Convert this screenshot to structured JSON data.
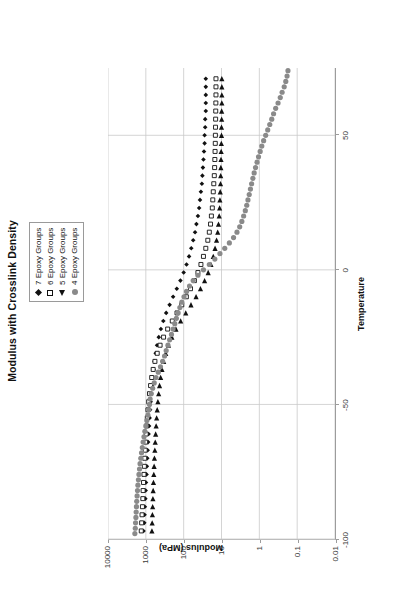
{
  "chart_data": {
    "type": "scatter",
    "title": "Modulus with Crosslink Density",
    "xlabel": "Temperature",
    "ylabel": "Modulus (MPa)",
    "xlim": [
      -100,
      75
    ],
    "ylim": [
      0.01,
      10000
    ],
    "yscale": "log",
    "xticks": [
      -100,
      -50,
      0,
      50
    ],
    "xticklabels": [
      "-100",
      "-50",
      "0",
      "50"
    ],
    "yticks": [
      10000,
      1000,
      100,
      10,
      1,
      0.1,
      0.01
    ],
    "yticklabels": [
      "10000",
      "1000",
      "100",
      "10",
      "1",
      "0.1",
      "0.01"
    ],
    "grid": "y-decades-and-x-ticks",
    "legend_position": "top-center-above-plot",
    "series": [
      {
        "name": "7 Epoxy Groups",
        "marker": "filled-diamond",
        "color": "#111111",
        "points": [
          [
            -97,
            1150
          ],
          [
            -94,
            1100
          ],
          [
            -91,
            1080
          ],
          [
            -88,
            1060
          ],
          [
            -85,
            1030
          ],
          [
            -82,
            1010
          ],
          [
            -79,
            990
          ],
          [
            -76,
            960
          ],
          [
            -73,
            940
          ],
          [
            -70,
            915
          ],
          [
            -67,
            895
          ],
          [
            -64,
            870
          ],
          [
            -61,
            845
          ],
          [
            -58,
            820
          ],
          [
            -55,
            795
          ],
          [
            -52,
            770
          ],
          [
            -49,
            745
          ],
          [
            -46,
            720
          ],
          [
            -43,
            690
          ],
          [
            -40,
            660
          ],
          [
            -37,
            625
          ],
          [
            -34,
            590
          ],
          [
            -31,
            550
          ],
          [
            -28,
            505
          ],
          [
            -25,
            455
          ],
          [
            -22,
            400
          ],
          [
            -19,
            345
          ],
          [
            -16,
            290
          ],
          [
            -13,
            235
          ],
          [
            -10,
            190
          ],
          [
            -7,
            152
          ],
          [
            -4,
            122
          ],
          [
            -1,
            100
          ],
          [
            2,
            84
          ],
          [
            5,
            72
          ],
          [
            8,
            63
          ],
          [
            11,
            56
          ],
          [
            14,
            50
          ],
          [
            17,
            46
          ],
          [
            20,
            42
          ],
          [
            23,
            39
          ],
          [
            26,
            37
          ],
          [
            29,
            35
          ],
          [
            32,
            33
          ],
          [
            35,
            32
          ],
          [
            38,
            31
          ],
          [
            41,
            30
          ],
          [
            44,
            29
          ],
          [
            47,
            28
          ],
          [
            50,
            28
          ],
          [
            53,
            27
          ],
          [
            56,
            27
          ],
          [
            59,
            26
          ],
          [
            62,
            26
          ],
          [
            65,
            26
          ],
          [
            68,
            26
          ],
          [
            71,
            26
          ]
        ]
      },
      {
        "name": "6 Epoxy Groups",
        "marker": "open-square",
        "color": "#111111",
        "points": [
          [
            -97,
            1320
          ],
          [
            -94,
            1290
          ],
          [
            -91,
            1260
          ],
          [
            -88,
            1230
          ],
          [
            -85,
            1200
          ],
          [
            -82,
            1180
          ],
          [
            -79,
            1150
          ],
          [
            -76,
            1120
          ],
          [
            -73,
            1095
          ],
          [
            -70,
            1070
          ],
          [
            -67,
            1040
          ],
          [
            -64,
            1010
          ],
          [
            -61,
            980
          ],
          [
            -58,
            950
          ],
          [
            -55,
            915
          ],
          [
            -52,
            880
          ],
          [
            -49,
            840
          ],
          [
            -46,
            800
          ],
          [
            -43,
            750
          ],
          [
            -40,
            700
          ],
          [
            -37,
            640
          ],
          [
            -34,
            575
          ],
          [
            -31,
            500
          ],
          [
            -28,
            420
          ],
          [
            -25,
            340
          ],
          [
            -22,
            265
          ],
          [
            -19,
            200
          ],
          [
            -16,
            150
          ],
          [
            -13,
            112
          ],
          [
            -10,
            85
          ],
          [
            -7,
            66
          ],
          [
            -4,
            52
          ],
          [
            -1,
            42
          ],
          [
            2,
            35
          ],
          [
            5,
            30
          ],
          [
            8,
            26
          ],
          [
            11,
            23
          ],
          [
            14,
            21
          ],
          [
            17,
            19.5
          ],
          [
            20,
            18.5
          ],
          [
            23,
            17.5
          ],
          [
            26,
            17
          ],
          [
            29,
            16.5
          ],
          [
            32,
            16
          ],
          [
            35,
            15.5
          ],
          [
            38,
            15.2
          ],
          [
            41,
            15
          ],
          [
            44,
            14.8
          ],
          [
            47,
            14.6
          ],
          [
            50,
            14.5
          ],
          [
            53,
            14.4
          ],
          [
            56,
            14.3
          ],
          [
            59,
            14.2
          ],
          [
            62,
            14.1
          ],
          [
            65,
            14
          ],
          [
            68,
            14
          ],
          [
            71,
            14
          ]
        ]
      },
      {
        "name": "5 Epoxy Groups",
        "marker": "filled-triangle",
        "color": "#111111",
        "points": [
          [
            -97,
            690
          ],
          [
            -94,
            680
          ],
          [
            -91,
            670
          ],
          [
            -88,
            660
          ],
          [
            -85,
            650
          ],
          [
            -82,
            640
          ],
          [
            -79,
            628
          ],
          [
            -76,
            616
          ],
          [
            -73,
            604
          ],
          [
            -70,
            592
          ],
          [
            -67,
            578
          ],
          [
            -64,
            564
          ],
          [
            -61,
            550
          ],
          [
            -58,
            534
          ],
          [
            -55,
            518
          ],
          [
            -52,
            500
          ],
          [
            -49,
            480
          ],
          [
            -46,
            458
          ],
          [
            -43,
            434
          ],
          [
            -40,
            406
          ],
          [
            -37,
            374
          ],
          [
            -34,
            338
          ],
          [
            -31,
            298
          ],
          [
            -28,
            252
          ],
          [
            -25,
            205
          ],
          [
            -22,
            160
          ],
          [
            -19,
            120
          ],
          [
            -16,
            88
          ],
          [
            -13,
            64
          ],
          [
            -10,
            47
          ],
          [
            -7,
            36
          ],
          [
            -4,
            28
          ],
          [
            -1,
            22.5
          ],
          [
            2,
            19
          ],
          [
            5,
            16.5
          ],
          [
            8,
            14.8
          ],
          [
            11,
            13.5
          ],
          [
            14,
            12.6
          ],
          [
            17,
            12
          ],
          [
            20,
            11.5
          ],
          [
            23,
            11.2
          ],
          [
            26,
            11
          ],
          [
            29,
            10.8
          ],
          [
            32,
            10.6
          ],
          [
            35,
            10.5
          ],
          [
            38,
            10.4
          ],
          [
            41,
            10.3
          ],
          [
            44,
            10.2
          ],
          [
            47,
            10.1
          ],
          [
            50,
            10
          ],
          [
            53,
            10
          ],
          [
            56,
            9.9
          ],
          [
            59,
            9.9
          ],
          [
            62,
            9.8
          ],
          [
            65,
            9.8
          ],
          [
            68,
            9.8
          ],
          [
            71,
            9.8
          ]
        ]
      },
      {
        "name": "4 Epoxy Groups",
        "marker": "filled-circle",
        "color": "#8a8a8a",
        "points": [
          [
            -98,
            1950
          ],
          [
            -96,
            1900
          ],
          [
            -94,
            1870
          ],
          [
            -92,
            1830
          ],
          [
            -90,
            1800
          ],
          [
            -88,
            1770
          ],
          [
            -86,
            1740
          ],
          [
            -84,
            1700
          ],
          [
            -82,
            1660
          ],
          [
            -80,
            1620
          ],
          [
            -78,
            1570
          ],
          [
            -76,
            1520
          ],
          [
            -74,
            1470
          ],
          [
            -72,
            1420
          ],
          [
            -70,
            1360
          ],
          [
            -68,
            1300
          ],
          [
            -66,
            1240
          ],
          [
            -64,
            1180
          ],
          [
            -62,
            1120
          ],
          [
            -60,
            1060
          ],
          [
            -58,
            1000
          ],
          [
            -56,
            940
          ],
          [
            -54,
            880
          ],
          [
            -52,
            830
          ],
          [
            -50,
            800
          ],
          [
            -48,
            770
          ],
          [
            -46,
            720
          ],
          [
            -44,
            660
          ],
          [
            -42,
            600
          ],
          [
            -40,
            540
          ],
          [
            -38,
            470
          ],
          [
            -36,
            410
          ],
          [
            -34,
            360
          ],
          [
            -32,
            320
          ],
          [
            -30,
            290
          ],
          [
            -28,
            260
          ],
          [
            -26,
            235
          ],
          [
            -24,
            210
          ],
          [
            -22,
            190
          ],
          [
            -20,
            172
          ],
          [
            -18,
            156
          ],
          [
            -16,
            140
          ],
          [
            -14,
            126
          ],
          [
            -12,
            112
          ],
          [
            -10,
            98
          ],
          [
            -8,
            84
          ],
          [
            -6,
            70
          ],
          [
            -4,
            56
          ],
          [
            -2,
            42
          ],
          [
            0,
            30
          ],
          [
            2,
            21
          ],
          [
            4,
            15
          ],
          [
            6,
            11
          ],
          [
            8,
            8.2
          ],
          [
            10,
            6.2
          ],
          [
            12,
            4.8
          ],
          [
            14,
            3.9
          ],
          [
            16,
            3.3
          ],
          [
            18,
            2.9
          ],
          [
            20,
            2.6
          ],
          [
            22,
            2.35
          ],
          [
            24,
            2.15
          ],
          [
            26,
            2.0
          ],
          [
            28,
            1.85
          ],
          [
            30,
            1.72
          ],
          [
            32,
            1.6
          ],
          [
            34,
            1.48
          ],
          [
            36,
            1.37
          ],
          [
            38,
            1.26
          ],
          [
            40,
            1.15
          ],
          [
            42,
            1.05
          ],
          [
            44,
            0.95
          ],
          [
            46,
            0.86
          ],
          [
            48,
            0.77
          ],
          [
            50,
            0.68
          ],
          [
            52,
            0.6
          ],
          [
            54,
            0.53
          ],
          [
            56,
            0.47
          ],
          [
            58,
            0.42
          ],
          [
            60,
            0.37
          ],
          [
            62,
            0.32
          ],
          [
            64,
            0.28
          ],
          [
            66,
            0.25
          ],
          [
            68,
            0.22
          ],
          [
            70,
            0.2
          ],
          [
            72,
            0.185
          ],
          [
            74,
            0.175
          ]
        ]
      }
    ]
  },
  "legend": {
    "items": [
      {
        "label": "7 Epoxy Groups",
        "marker": "filled-diamond"
      },
      {
        "label": "6 Epoxy Groups",
        "marker": "open-square"
      },
      {
        "label": "5 Epoxy Groups",
        "marker": "filled-triangle"
      },
      {
        "label": "4 Epoxy Groups",
        "marker": "filled-circle"
      }
    ]
  }
}
